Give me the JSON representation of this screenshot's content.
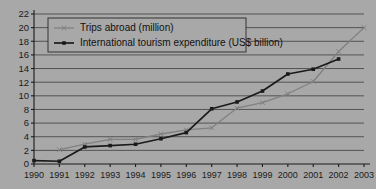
{
  "chart_data": {
    "type": "line",
    "title": "",
    "xlabel": "",
    "ylabel": "",
    "x": [
      1990,
      1991,
      1992,
      1993,
      1994,
      1995,
      1996,
      1997,
      1998,
      1999,
      2000,
      2001,
      2002,
      2003
    ],
    "categories": [
      "1990",
      "1991",
      "1992",
      "1993",
      "1994",
      "1995",
      "1996",
      "1997",
      "1998",
      "1999",
      "2000",
      "2001",
      "2002",
      "2003"
    ],
    "ylim": [
      0,
      22
    ],
    "ytick_labels": [
      "0",
      "2",
      "4",
      "6",
      "8",
      "10",
      "12",
      "14",
      "16",
      "18",
      "20",
      "22"
    ],
    "ytick_values": [
      0,
      2,
      4,
      6,
      8,
      10,
      12,
      14,
      16,
      18,
      20,
      22
    ],
    "grid": true,
    "legend_position": "top-left",
    "series": [
      {
        "name": "Trips abroad (million)",
        "color": "#808080",
        "marker": "x",
        "values": [
          null,
          2.1,
          2.9,
          3.6,
          3.6,
          4.4,
          5.0,
          5.3,
          8.2,
          9.0,
          10.3,
          12.1,
          16.5,
          20.0
        ]
      },
      {
        "name": "International tourism expenditure (US$ billion)",
        "color": "#1a1a1a",
        "marker": "square",
        "values": [
          0.5,
          0.4,
          2.5,
          2.7,
          2.9,
          3.7,
          4.6,
          8.1,
          9.1,
          10.7,
          13.2,
          13.9,
          15.4,
          null
        ]
      }
    ]
  },
  "legend": {
    "items": [
      {
        "label": "Trips abroad (million)"
      },
      {
        "label": "International tourism expenditure (US$ billion)"
      }
    ]
  },
  "colors": {
    "background": "#a8a8a8",
    "gridline": "#4a4a4a",
    "axis": "#1a1a1a",
    "series_gray": "#808080",
    "series_black": "#1a1a1a",
    "legend_border": "#333333"
  }
}
